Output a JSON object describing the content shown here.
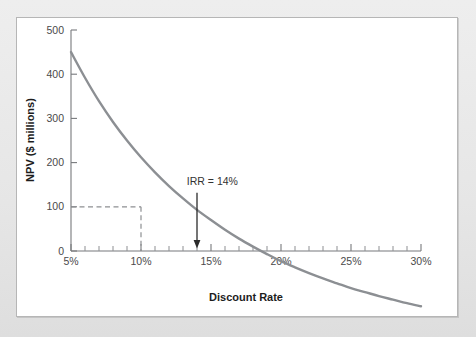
{
  "figure": {
    "panel_background": "#ffffff",
    "mat_background": "#e8e8e8",
    "border_color": "#b6b6b6"
  },
  "chart_data": {
    "type": "line",
    "title": "",
    "xlabel": "Discount Rate",
    "ylabel": "NPV ($ millions)",
    "xlim": [
      5,
      30
    ],
    "ylim": [
      -120,
      500
    ],
    "grid": false,
    "legend": null,
    "curve_color": "#8c8f93",
    "x_ticks_major": [
      5,
      10,
      15,
      20,
      25,
      30
    ],
    "x_tick_labels": [
      "5%",
      "10%",
      "15%",
      "20%",
      "25%",
      "30%"
    ],
    "x_tick_minor_step": 1,
    "y_ticks": [
      0,
      100,
      200,
      300,
      400,
      500
    ],
    "y_tick_labels": [
      "0",
      "100",
      "200",
      "300",
      "400",
      "500"
    ],
    "series": [
      {
        "name": "NPV",
        "x": [
          5,
          6,
          7,
          8,
          9,
          10,
          11,
          12,
          13,
          14,
          15,
          16,
          17,
          18,
          19,
          20,
          21,
          22,
          23,
          24,
          25,
          26,
          27,
          28,
          29,
          30
        ],
        "values": [
          450,
          392,
          339,
          292,
          250,
          212,
          178,
          147,
          119,
          93,
          70,
          48,
          28,
          10,
          -7,
          -23,
          -37,
          -50,
          -62,
          -73,
          -84,
          -93,
          -102,
          -110,
          -118,
          -125
        ]
      }
    ],
    "annotations": [
      {
        "name": "irr-label",
        "text": "IRR = 14%",
        "x": 15.1,
        "y": 150,
        "arrow_to_x": 14,
        "arrow_to_y": 0
      },
      {
        "name": "npv-at-10-percent-guide",
        "text": "",
        "guide_x": 10,
        "guide_y": 100
      }
    ]
  }
}
